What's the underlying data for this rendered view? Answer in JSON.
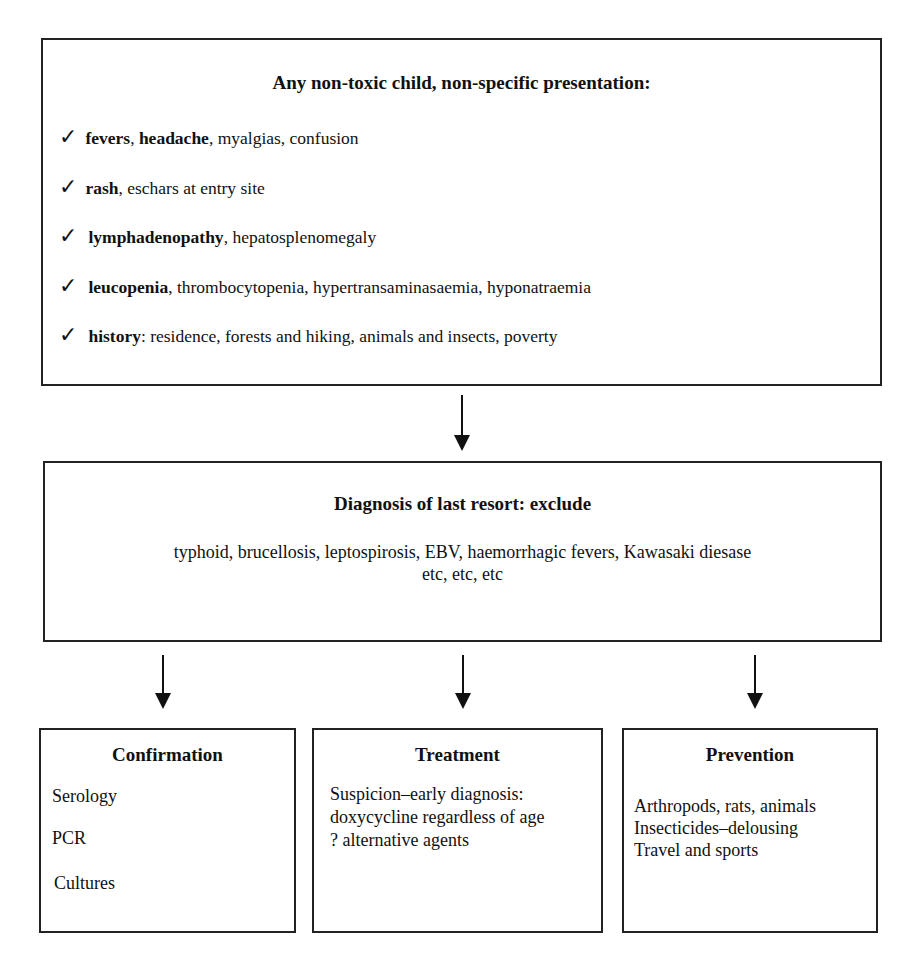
{
  "top_box": {
    "title": "Any non-toxic child, non-specific presentation:",
    "check_icon": "✓",
    "items": [
      {
        "lead": "fevers",
        "sep1": ", ",
        "lead2": "headache",
        "rest": ", myalgias, confusion"
      },
      {
        "lead": "rash",
        "rest": ", eschars at entry site"
      },
      {
        "lead": "lymphadenopathy",
        "rest": ", hepatosplenomegaly"
      },
      {
        "lead": "leucopenia",
        "rest": ", thrombocytopenia, hypertransaminasaemia, hyponatraemia"
      },
      {
        "lead": "history",
        "rest": ": residence, forests and hiking, animals and insects, poverty"
      }
    ]
  },
  "middle_box": {
    "title": "Diagnosis of last resort: exclude",
    "line1": "typhoid, brucellosis, leptospirosis, EBV, haemorrhagic fevers, Kawasaki diesase",
    "line2": "etc, etc, etc"
  },
  "bottom_boxes": [
    {
      "title": "Confirmation",
      "lines": [
        "Serology",
        "PCR",
        "Cultures"
      ]
    },
    {
      "title": "Treatment",
      "lines": [
        "Suspicion–early diagnosis:",
        "doxycycline regardless of age",
        "? alternative agents"
      ]
    },
    {
      "title": "Prevention",
      "lines": [
        "Arthropods, rats, animals",
        "Insecticides–delousing",
        "Travel and sports"
      ]
    }
  ]
}
